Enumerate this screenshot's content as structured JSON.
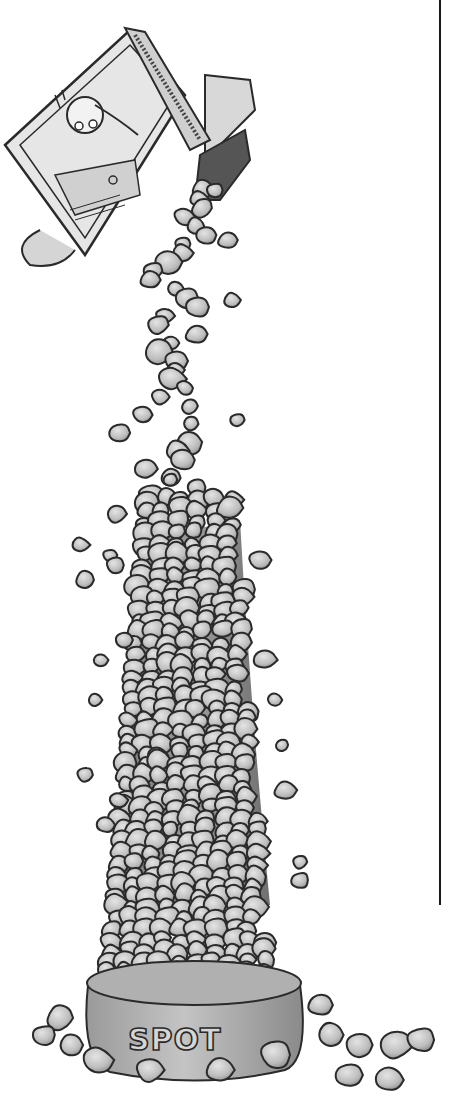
{
  "illustration": {
    "description": "Black-and-white pen illustration of a box pouring a tall column of kibble into a dog bowl",
    "bowl": {
      "label": "SPOT"
    },
    "box": {
      "character": "cartoon dog face on box front panel"
    },
    "colors": {
      "background": "#ffffff",
      "ink": "#2a2a2a",
      "kibble_fill": "#bdbdbd",
      "kibble_light": "#dcdcdc",
      "bowl_fill": "#a9a9a9",
      "box_fill": "#e6e6e6",
      "rule": "#1a1a1a"
    }
  },
  "rule": {
    "x_top": 438,
    "x_bottom": 441,
    "y_top": 0,
    "y_bottom": 905
  }
}
